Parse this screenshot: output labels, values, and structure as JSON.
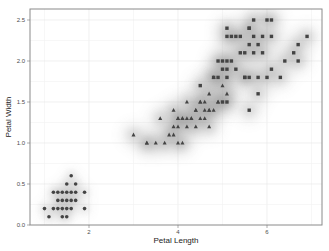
{
  "chart_data": {
    "type": "scatter",
    "title": "",
    "xlabel": "Petal Length",
    "ylabel": "Petal Width",
    "xlim": [
      0.95,
      7.25
    ],
    "ylim": [
      -0.02,
      2.6
    ],
    "x_ticks": [
      2,
      4,
      6
    ],
    "x_tick_labels": [
      "2",
      "4",
      "6"
    ],
    "y_ticks": [
      0.0,
      0.5,
      1.0,
      1.5,
      2.0,
      2.5
    ],
    "y_tick_labels": [
      "0.0",
      "0.5",
      "1.0",
      "1.5",
      "2.0",
      "2.5"
    ],
    "grid": true,
    "legend": "none",
    "overlay": "2D density (filled contours, grayscale)",
    "point_color": "#444444",
    "series": [
      {
        "name": "setosa",
        "marker": "circle",
        "points": [
          [
            1.4,
            0.2
          ],
          [
            1.3,
            0.2
          ],
          [
            1.5,
            0.2
          ],
          [
            1.7,
            0.4
          ],
          [
            1.4,
            0.3
          ],
          [
            1.5,
            0.1
          ],
          [
            1.6,
            0.2
          ],
          [
            1.1,
            0.1
          ],
          [
            1.2,
            0.2
          ],
          [
            1.0,
            0.2
          ],
          [
            1.7,
            0.5
          ],
          [
            1.9,
            0.2
          ],
          [
            1.6,
            0.4
          ],
          [
            1.5,
            0.4
          ],
          [
            1.4,
            0.1
          ],
          [
            1.6,
            0.6
          ],
          [
            1.9,
            0.4
          ],
          [
            1.3,
            0.3
          ],
          [
            1.3,
            0.4
          ],
          [
            1.5,
            0.3
          ],
          [
            1.4,
            0.4
          ],
          [
            1.6,
            0.3
          ],
          [
            1.7,
            0.3
          ],
          [
            1.2,
            0.4
          ],
          [
            1.5,
            0.5
          ]
        ]
      },
      {
        "name": "versicolor",
        "marker": "triangle",
        "points": [
          [
            4.7,
            1.4
          ],
          [
            4.5,
            1.5
          ],
          [
            4.9,
            1.5
          ],
          [
            4.0,
            1.3
          ],
          [
            4.6,
            1.5
          ],
          [
            4.5,
            1.3
          ],
          [
            4.7,
            1.6
          ],
          [
            3.3,
            1.0
          ],
          [
            4.6,
            1.3
          ],
          [
            3.9,
            1.4
          ],
          [
            3.5,
            1.0
          ],
          [
            4.2,
            1.5
          ],
          [
            4.0,
            1.0
          ],
          [
            4.7,
            1.4
          ],
          [
            3.6,
            1.3
          ],
          [
            4.4,
            1.4
          ],
          [
            4.1,
            1.0
          ],
          [
            4.5,
            1.5
          ],
          [
            3.9,
            1.1
          ],
          [
            4.8,
            1.8
          ],
          [
            4.0,
            1.3
          ],
          [
            4.9,
            1.5
          ],
          [
            4.7,
            1.2
          ],
          [
            4.3,
            1.3
          ],
          [
            4.4,
            1.4
          ],
          [
            4.8,
            1.4
          ],
          [
            5.0,
            1.7
          ],
          [
            3.8,
            1.1
          ],
          [
            3.7,
            1.0
          ],
          [
            3.9,
            1.2
          ],
          [
            5.1,
            1.6
          ],
          [
            4.2,
            1.3
          ],
          [
            4.1,
            1.3
          ],
          [
            3.0,
            1.1
          ],
          [
            4.4,
            1.2
          ],
          [
            4.6,
            1.4
          ],
          [
            4.0,
            1.2
          ],
          [
            3.3,
            1.0
          ],
          [
            4.2,
            1.2
          ],
          [
            4.3,
            1.3
          ],
          [
            4.1,
            1.3
          ]
        ]
      },
      {
        "name": "virginica",
        "marker": "square",
        "points": [
          [
            6.0,
            2.5
          ],
          [
            5.1,
            1.9
          ],
          [
            5.9,
            2.1
          ],
          [
            5.6,
            1.8
          ],
          [
            5.8,
            2.2
          ],
          [
            6.6,
            2.1
          ],
          [
            4.5,
            1.7
          ],
          [
            6.3,
            1.8
          ],
          [
            5.8,
            1.8
          ],
          [
            6.1,
            2.5
          ],
          [
            5.1,
            2.0
          ],
          [
            5.3,
            1.9
          ],
          [
            5.5,
            2.1
          ],
          [
            5.0,
            2.0
          ],
          [
            5.1,
            2.4
          ],
          [
            5.3,
            2.3
          ],
          [
            5.5,
            1.8
          ],
          [
            6.7,
            2.2
          ],
          [
            6.9,
            2.3
          ],
          [
            5.0,
            1.5
          ],
          [
            5.7,
            2.3
          ],
          [
            4.9,
            2.0
          ],
          [
            6.7,
            2.0
          ],
          [
            4.9,
            1.8
          ],
          [
            5.7,
            2.1
          ],
          [
            6.0,
            1.8
          ],
          [
            4.8,
            1.8
          ],
          [
            5.8,
            1.6
          ],
          [
            6.1,
            1.9
          ],
          [
            6.4,
            2.0
          ],
          [
            5.6,
            2.2
          ],
          [
            5.1,
            1.5
          ],
          [
            5.6,
            1.4
          ],
          [
            6.1,
            2.3
          ],
          [
            5.6,
            2.4
          ],
          [
            5.5,
            1.8
          ],
          [
            5.4,
            2.1
          ],
          [
            5.6,
            2.4
          ],
          [
            5.1,
            2.3
          ],
          [
            5.9,
            2.3
          ],
          [
            5.7,
            2.5
          ],
          [
            5.2,
            2.3
          ],
          [
            5.0,
            1.9
          ],
          [
            5.2,
            2.0
          ],
          [
            5.4,
            2.3
          ],
          [
            5.1,
            1.8
          ]
        ]
      }
    ]
  }
}
